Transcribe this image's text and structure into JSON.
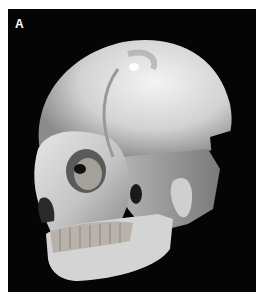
{
  "figure": {
    "panel_label": "A",
    "background_color": "#050505",
    "bone_color": "#d8d8d8"
  }
}
